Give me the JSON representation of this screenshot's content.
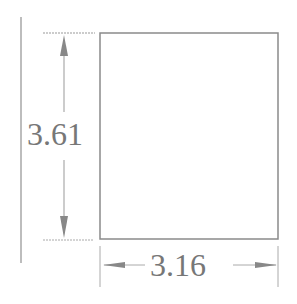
{
  "diagram": {
    "shape": "rectangle",
    "height_label": "3.61",
    "width_label": "3.16",
    "colors": {
      "stroke": "#8a8a8a",
      "text": "#777777",
      "background": "#ffffff"
    }
  }
}
